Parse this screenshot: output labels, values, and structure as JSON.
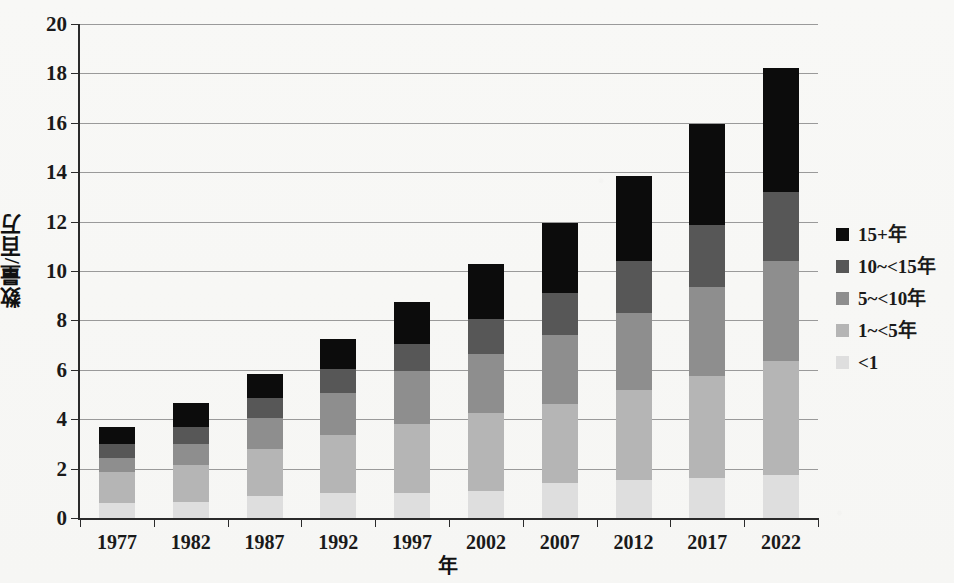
{
  "chart_data": {
    "type": "bar",
    "stacked": true,
    "title": "",
    "xlabel": "年",
    "ylabel": "数量/百万",
    "categories": [
      "1977",
      "1982",
      "1987",
      "1992",
      "1997",
      "2002",
      "2007",
      "2012",
      "2017",
      "2022"
    ],
    "ylim": [
      0,
      20
    ],
    "ytick_labels": [
      "0",
      "2",
      "4",
      "6",
      "8",
      "10",
      "12",
      "14",
      "16",
      "18",
      "20"
    ],
    "ytick_values": [
      0,
      2,
      4,
      6,
      8,
      10,
      12,
      14,
      16,
      18,
      20
    ],
    "grid": "horizontal",
    "legend_position": "right",
    "series": [
      {
        "name": "<1",
        "color": "#dedede",
        "values": [
          0.6,
          0.65,
          0.9,
          1.0,
          1.0,
          1.1,
          1.4,
          1.55,
          1.6,
          1.75
        ]
      },
      {
        "name": "1~<5年",
        "color": "#b5b5b5",
        "values": [
          1.25,
          1.5,
          1.9,
          2.35,
          2.8,
          3.15,
          3.2,
          3.65,
          4.15,
          4.6
        ]
      },
      {
        "name": "5~<10年",
        "color": "#8e8e8e",
        "values": [
          0.6,
          0.85,
          1.25,
          1.7,
          2.15,
          2.4,
          2.8,
          3.1,
          3.6,
          4.05
        ]
      },
      {
        "name": "10~<15年",
        "color": "#575757",
        "values": [
          0.55,
          0.7,
          0.8,
          1.0,
          1.1,
          1.4,
          1.7,
          2.1,
          2.5,
          2.8
        ]
      },
      {
        "name": "15+年",
        "color": "#0c0c0c",
        "values": [
          0.67,
          0.95,
          1.0,
          1.2,
          1.7,
          2.25,
          2.85,
          3.45,
          4.1,
          5.0
        ]
      }
    ],
    "totals": [
      3.67,
      4.65,
      5.85,
      7.25,
      8.75,
      10.3,
      11.95,
      13.85,
      15.95,
      18.2
    ]
  },
  "legend": {
    "entries": [
      {
        "label": "15+年",
        "color": "#0c0c0c"
      },
      {
        "label": "10~<15年",
        "color": "#575757"
      },
      {
        "label": "5~<10年",
        "color": "#8e8e8e"
      },
      {
        "label": "1~<5年",
        "color": "#b5b5b5"
      },
      {
        "label": "<1",
        "color": "#dedede"
      }
    ]
  },
  "axes": {
    "y_title": "数量/百万",
    "x_title": "年"
  }
}
